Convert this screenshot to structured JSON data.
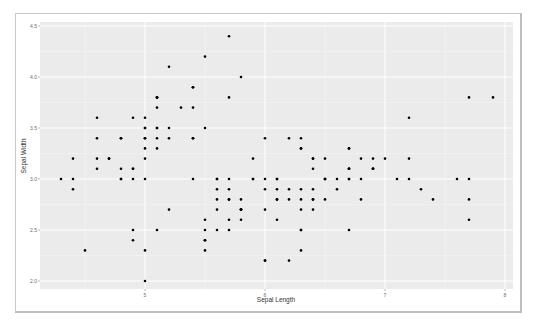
{
  "chart_data": {
    "type": "scatter",
    "title": "",
    "xlabel": "Sepal Length",
    "ylabel": "Sepal Width",
    "xlim": [
      4.2,
      8.1
    ],
    "ylim": [
      1.9,
      4.55
    ],
    "x_ticks": [
      5,
      6,
      7,
      8
    ],
    "x_tick_labels": [
      "5",
      "6",
      "7",
      "8"
    ],
    "y_ticks": [
      2.0,
      2.5,
      3.0,
      3.5,
      4.0,
      4.5
    ],
    "y_tick_labels": [
      "2.0",
      "2.5",
      "3.0",
      "3.5",
      "4.0",
      "4.5"
    ],
    "grid": true,
    "legend": null,
    "colors": {
      "panel": "#ebebeb",
      "grid_major": "#ffffff",
      "point": "#000000"
    },
    "points": [
      [
        5.1,
        3.5
      ],
      [
        4.9,
        3.0
      ],
      [
        4.7,
        3.2
      ],
      [
        4.6,
        3.1
      ],
      [
        5.0,
        3.6
      ],
      [
        5.4,
        3.9
      ],
      [
        4.6,
        3.4
      ],
      [
        5.0,
        3.4
      ],
      [
        4.4,
        2.9
      ],
      [
        4.9,
        3.1
      ],
      [
        5.4,
        3.7
      ],
      [
        4.8,
        3.4
      ],
      [
        4.8,
        3.0
      ],
      [
        4.3,
        3.0
      ],
      [
        5.8,
        4.0
      ],
      [
        5.7,
        4.4
      ],
      [
        5.4,
        3.9
      ],
      [
        5.1,
        3.5
      ],
      [
        5.7,
        3.8
      ],
      [
        5.1,
        3.8
      ],
      [
        5.4,
        3.4
      ],
      [
        5.1,
        3.7
      ],
      [
        4.6,
        3.6
      ],
      [
        5.1,
        3.3
      ],
      [
        4.8,
        3.4
      ],
      [
        5.0,
        3.0
      ],
      [
        5.0,
        3.4
      ],
      [
        5.2,
        3.5
      ],
      [
        5.2,
        3.4
      ],
      [
        4.7,
        3.2
      ],
      [
        4.8,
        3.1
      ],
      [
        5.4,
        3.4
      ],
      [
        5.2,
        4.1
      ],
      [
        5.5,
        4.2
      ],
      [
        4.9,
        3.1
      ],
      [
        5.0,
        3.2
      ],
      [
        5.5,
        3.5
      ],
      [
        4.9,
        3.6
      ],
      [
        4.4,
        3.0
      ],
      [
        5.1,
        3.4
      ],
      [
        5.0,
        3.5
      ],
      [
        4.5,
        2.3
      ],
      [
        4.4,
        3.2
      ],
      [
        5.0,
        3.5
      ],
      [
        5.1,
        3.8
      ],
      [
        4.8,
        3.0
      ],
      [
        5.1,
        3.8
      ],
      [
        4.6,
        3.2
      ],
      [
        5.3,
        3.7
      ],
      [
        5.0,
        3.3
      ],
      [
        7.0,
        3.2
      ],
      [
        6.4,
        3.2
      ],
      [
        6.9,
        3.1
      ],
      [
        5.5,
        2.3
      ],
      [
        6.5,
        2.8
      ],
      [
        5.7,
        2.8
      ],
      [
        6.3,
        3.3
      ],
      [
        4.9,
        2.4
      ],
      [
        6.6,
        2.9
      ],
      [
        5.2,
        2.7
      ],
      [
        5.0,
        2.0
      ],
      [
        5.9,
        3.0
      ],
      [
        6.0,
        2.2
      ],
      [
        6.1,
        2.9
      ],
      [
        5.6,
        2.9
      ],
      [
        6.7,
        3.1
      ],
      [
        5.6,
        3.0
      ],
      [
        5.8,
        2.7
      ],
      [
        6.2,
        2.2
      ],
      [
        5.6,
        2.5
      ],
      [
        5.9,
        3.2
      ],
      [
        6.1,
        2.8
      ],
      [
        6.3,
        2.5
      ],
      [
        6.1,
        2.8
      ],
      [
        6.4,
        2.9
      ],
      [
        6.6,
        3.0
      ],
      [
        6.8,
        2.8
      ],
      [
        6.7,
        3.0
      ],
      [
        6.0,
        2.9
      ],
      [
        5.7,
        2.6
      ],
      [
        5.5,
        2.4
      ],
      [
        5.5,
        2.4
      ],
      [
        5.8,
        2.7
      ],
      [
        6.0,
        2.7
      ],
      [
        5.4,
        3.0
      ],
      [
        6.0,
        3.4
      ],
      [
        6.7,
        3.1
      ],
      [
        6.3,
        2.3
      ],
      [
        5.6,
        3.0
      ],
      [
        5.5,
        2.5
      ],
      [
        5.5,
        2.6
      ],
      [
        6.1,
        3.0
      ],
      [
        5.8,
        2.6
      ],
      [
        5.0,
        2.3
      ],
      [
        5.6,
        2.7
      ],
      [
        5.7,
        3.0
      ],
      [
        5.7,
        2.9
      ],
      [
        6.2,
        2.9
      ],
      [
        5.1,
        2.5
      ],
      [
        5.7,
        2.8
      ],
      [
        6.3,
        3.3
      ],
      [
        5.8,
        2.7
      ],
      [
        7.1,
        3.0
      ],
      [
        6.3,
        2.9
      ],
      [
        6.5,
        3.0
      ],
      [
        7.6,
        3.0
      ],
      [
        4.9,
        2.5
      ],
      [
        7.3,
        2.9
      ],
      [
        6.7,
        2.5
      ],
      [
        7.2,
        3.6
      ],
      [
        6.5,
        3.2
      ],
      [
        6.4,
        2.7
      ],
      [
        6.8,
        3.0
      ],
      [
        5.7,
        2.5
      ],
      [
        5.8,
        2.8
      ],
      [
        6.4,
        3.2
      ],
      [
        6.5,
        3.0
      ],
      [
        7.7,
        3.8
      ],
      [
        7.7,
        2.6
      ],
      [
        6.0,
        2.2
      ],
      [
        6.9,
        3.2
      ],
      [
        5.6,
        2.8
      ],
      [
        7.7,
        2.8
      ],
      [
        6.3,
        2.7
      ],
      [
        6.7,
        3.3
      ],
      [
        7.2,
        3.2
      ],
      [
        6.2,
        2.8
      ],
      [
        6.1,
        3.0
      ],
      [
        6.4,
        2.8
      ],
      [
        7.2,
        3.0
      ],
      [
        7.4,
        2.8
      ],
      [
        7.9,
        3.8
      ],
      [
        6.4,
        2.8
      ],
      [
        6.3,
        2.8
      ],
      [
        6.1,
        2.6
      ],
      [
        7.7,
        3.0
      ],
      [
        6.3,
        3.4
      ],
      [
        6.4,
        3.1
      ],
      [
        6.0,
        3.0
      ],
      [
        6.9,
        3.1
      ],
      [
        6.7,
        3.1
      ],
      [
        6.9,
        3.1
      ],
      [
        5.8,
        2.7
      ],
      [
        6.8,
        3.2
      ],
      [
        6.7,
        3.3
      ],
      [
        6.7,
        3.0
      ],
      [
        6.3,
        2.5
      ],
      [
        6.5,
        3.0
      ],
      [
        6.2,
        3.4
      ],
      [
        5.9,
        3.0
      ]
    ]
  }
}
